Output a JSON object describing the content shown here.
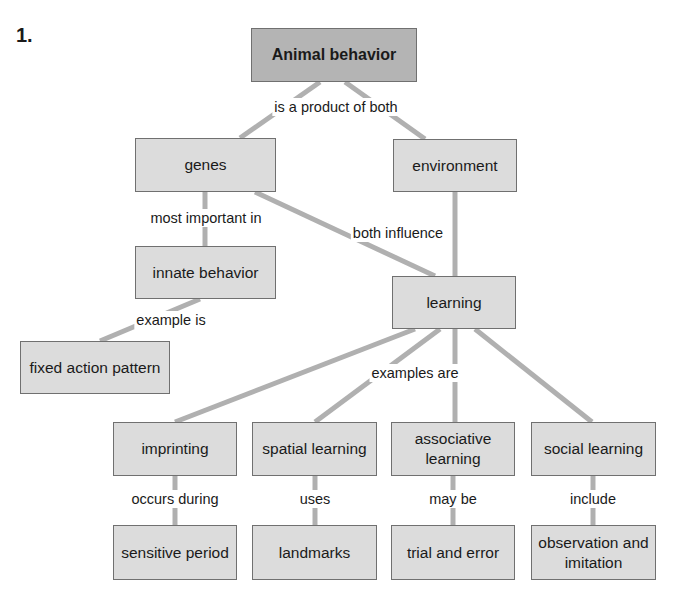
{
  "question_number": "1.",
  "nodes": {
    "animal_behavior": "Animal behavior",
    "genes": "genes",
    "environment": "environment",
    "innate_behavior": "innate behavior",
    "learning": "learning",
    "fixed_action_pattern": "fixed action pattern",
    "imprinting": "imprinting",
    "spatial_learning": "spatial learning",
    "associative_learning": "associative learning",
    "social_learning": "social learning",
    "sensitive_period": "sensitive period",
    "landmarks": "landmarks",
    "trial_and_error": "trial and error",
    "observation_imitation": "observation and imitation"
  },
  "links": {
    "product_of_both": "is a product of both",
    "most_important_in": "most important in",
    "both_influence": "both influence",
    "example_is": "example is",
    "examples_are": "examples are",
    "occurs_during": "occurs during",
    "uses": "uses",
    "may_be": "may be",
    "include": "include"
  },
  "colors": {
    "node": "#dcdcdc",
    "root": "#b4b4b4",
    "line": "#b0b0b0"
  }
}
